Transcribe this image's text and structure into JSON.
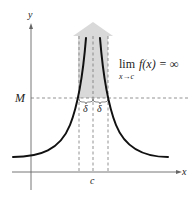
{
  "figure": {
    "axis_labels": {
      "x": "x",
      "y": "y"
    },
    "level_label": "M",
    "point_label": "c",
    "delta_labels": [
      "δ",
      "δ"
    ],
    "limit": {
      "lim": "lim",
      "expr": "f(x) = ∞",
      "sub": "x→c"
    },
    "colors": {
      "curve": "#111111",
      "axis": "#555555",
      "dashed": "#777777",
      "arrow_fill": "#d9d9d9",
      "background": "#ffffff"
    }
  }
}
